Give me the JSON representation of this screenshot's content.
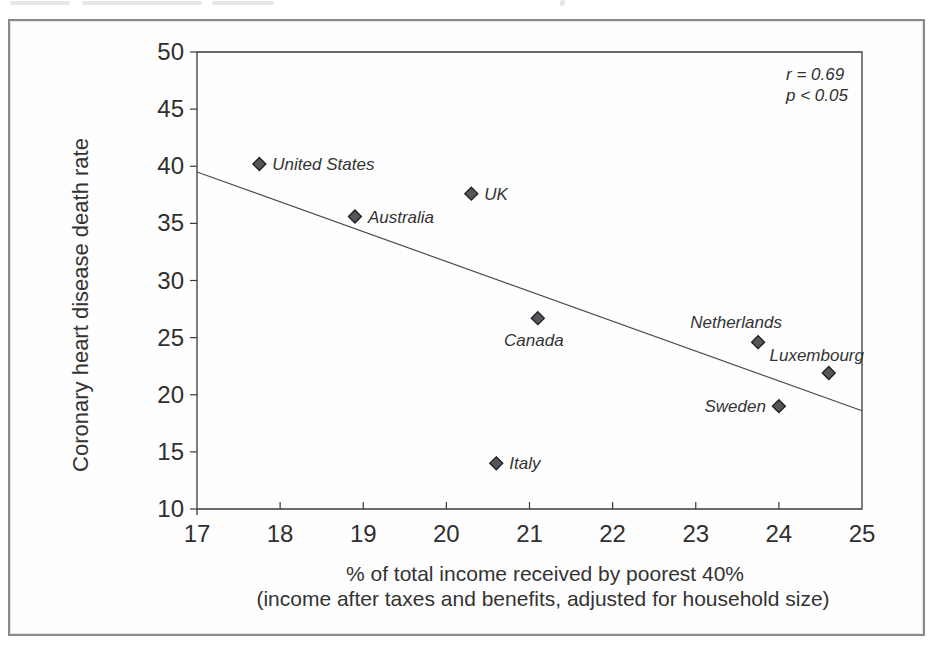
{
  "figure": {
    "annotation": {
      "line1": "r = 0.69",
      "line2": "p < 0.05"
    },
    "x_axis": {
      "title_line1": "% of total income received by poorest 40%",
      "title_line2": "(income after taxes and benefits, adjusted for household size)"
    },
    "y_axis": {
      "title": "Coronary heart disease death rate"
    }
  },
  "chart_data": {
    "type": "scatter",
    "title": "",
    "xlabel": "% of total income received by poorest 40% (income after taxes and benefits, adjusted for household size)",
    "ylabel": "Coronary heart disease death rate",
    "xlim": [
      17,
      25
    ],
    "ylim": [
      10,
      50
    ],
    "x_ticks": [
      17,
      18,
      19,
      20,
      21,
      22,
      23,
      24,
      25
    ],
    "y_ticks": [
      10,
      15,
      20,
      25,
      30,
      35,
      40,
      45,
      50
    ],
    "grid": false,
    "legend": "none",
    "points": [
      {
        "label": "United States",
        "x": 17.75,
        "y": 40.2,
        "label_pos": "right"
      },
      {
        "label": "Australia",
        "x": 18.9,
        "y": 35.6,
        "label_pos": "right"
      },
      {
        "label": "UK",
        "x": 20.3,
        "y": 37.6,
        "label_pos": "right"
      },
      {
        "label": "Canada",
        "x": 21.1,
        "y": 26.7,
        "label_pos": "below-left"
      },
      {
        "label": "Italy",
        "x": 20.6,
        "y": 14.0,
        "label_pos": "right"
      },
      {
        "label": "Netherlands",
        "x": 23.75,
        "y": 24.6,
        "label_pos": "above"
      },
      {
        "label": "Sweden",
        "x": 24.0,
        "y": 19.0,
        "label_pos": "left"
      },
      {
        "label": "Luxembourg",
        "x": 24.6,
        "y": 21.9,
        "label_pos": "above-sm"
      }
    ],
    "trend_line": {
      "x1": 17,
      "y1": 39.5,
      "x2": 25,
      "y2": 18.6
    },
    "annotation": [
      "r = 0.69",
      "p < 0.05"
    ],
    "marker": {
      "shape": "diamond",
      "size": 13,
      "fill": "#56565a",
      "stroke": "#1f1f23"
    },
    "colors": {
      "axis": "#3a3a3a",
      "text": "#333333",
      "frame": "#8a8a8a",
      "trend": "#4a4a4a",
      "background": "#ffffff"
    }
  }
}
